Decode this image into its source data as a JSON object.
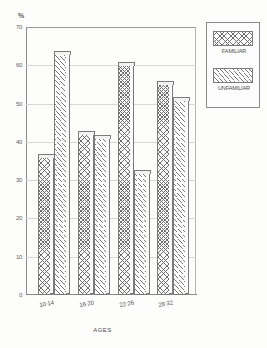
{
  "chart_data": {
    "type": "bar",
    "title": "",
    "subtitle": "",
    "xlabel": "AGES",
    "ylabel": "%",
    "ylim": [
      0,
      70
    ],
    "ytick_labels": [
      "70",
      "60",
      "50",
      "40",
      "30",
      "20",
      "10",
      "0"
    ],
    "yticks": [
      70,
      60,
      50,
      40,
      30,
      20,
      10,
      0
    ],
    "grid": true,
    "legend_position": "right",
    "categories": [
      "10-14",
      "16-20",
      "22-26",
      "28-32"
    ],
    "series": [
      {
        "name": "FAMILIAR",
        "pattern": "crosshatch",
        "values": [
          36,
          42,
          60,
          55
        ]
      },
      {
        "name": "UNFAMILIAR",
        "pattern": "diagonal",
        "values": [
          63,
          41,
          32,
          51
        ]
      }
    ]
  },
  "axes": {
    "percent_symbol": "%",
    "x_title": "AGES"
  },
  "legend": {
    "entries": [
      {
        "label": "FAMILIAR"
      },
      {
        "label": "UNFAMILIAR"
      }
    ]
  }
}
